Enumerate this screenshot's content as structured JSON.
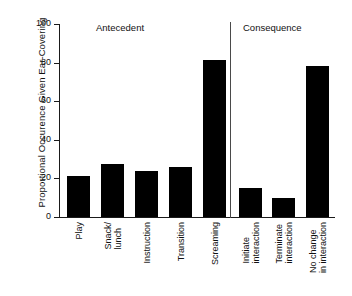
{
  "chart_data": {
    "type": "bar",
    "title": "",
    "xlabel": "",
    "ylabel": "Proportional Occurence Given Ear-Covering",
    "ylim": [
      0,
      100
    ],
    "yticks": [
      0,
      20,
      40,
      60,
      80,
      100
    ],
    "grid": false,
    "legend": false,
    "categories": [
      "Play",
      "Snack/ lunch",
      "Instruction",
      "Transition",
      "Screaming",
      "Initiate interaction",
      "Terminate interaction",
      "No change in interaction"
    ],
    "category_lines": [
      [
        "Play"
      ],
      [
        "Snack/",
        "lunch"
      ],
      [
        "Instruction"
      ],
      [
        "Transition"
      ],
      [
        "Screaming"
      ],
      [
        "Initiate",
        "interaction"
      ],
      [
        "Terminate",
        "interaction"
      ],
      [
        "No change",
        "in interaction"
      ]
    ],
    "values": [
      21.5,
      27.5,
      24,
      26,
      81.5,
      15,
      10,
      78.5
    ],
    "groups": [
      {
        "label": "Antecedent",
        "categories": [
          "Play",
          "Snack/ lunch",
          "Instruction",
          "Transition",
          "Screaming"
        ]
      },
      {
        "label": "Consequence",
        "categories": [
          "Initiate interaction",
          "Terminate interaction",
          "No change in interaction"
        ]
      }
    ],
    "bar_color": "#000000",
    "axis_color": "#1a1a1a"
  },
  "axis": {
    "ytick_labels": [
      "0",
      "20",
      "40",
      "60",
      "80",
      "100"
    ],
    "y_title": "Proportional Occurence Given Ear-Covering"
  },
  "groups": {
    "antecedent": "Antecedent",
    "consequence": "Consequence"
  }
}
